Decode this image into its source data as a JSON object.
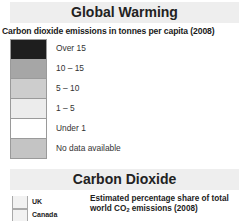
{
  "global_warming": {
    "title": "Global Warming",
    "subtitle": "Carbon dioxide emissions in tonnes per capita (2008)",
    "legend": [
      {
        "label": "Over 15",
        "color": "#1e1e1e"
      },
      {
        "label": "10 – 15",
        "color": "#a6a6a6"
      },
      {
        "label": "5 – 10",
        "color": "#cdcdcd"
      },
      {
        "label": "1 – 5",
        "color": "#ececec"
      },
      {
        "label": "Under 1",
        "color": "#ffffff"
      },
      {
        "label": "No data available",
        "color": "#c4c4c4"
      }
    ]
  },
  "carbon_dioxide": {
    "title": "Carbon Dioxide",
    "description_line1": "Estimated percentage share of total",
    "description_line2_prefix": "world CO",
    "description_line2_sub": "2",
    "description_line2_suffix": " emissions (2008)",
    "legend": [
      {
        "label": "UK"
      },
      {
        "label": "Canada"
      }
    ]
  }
}
